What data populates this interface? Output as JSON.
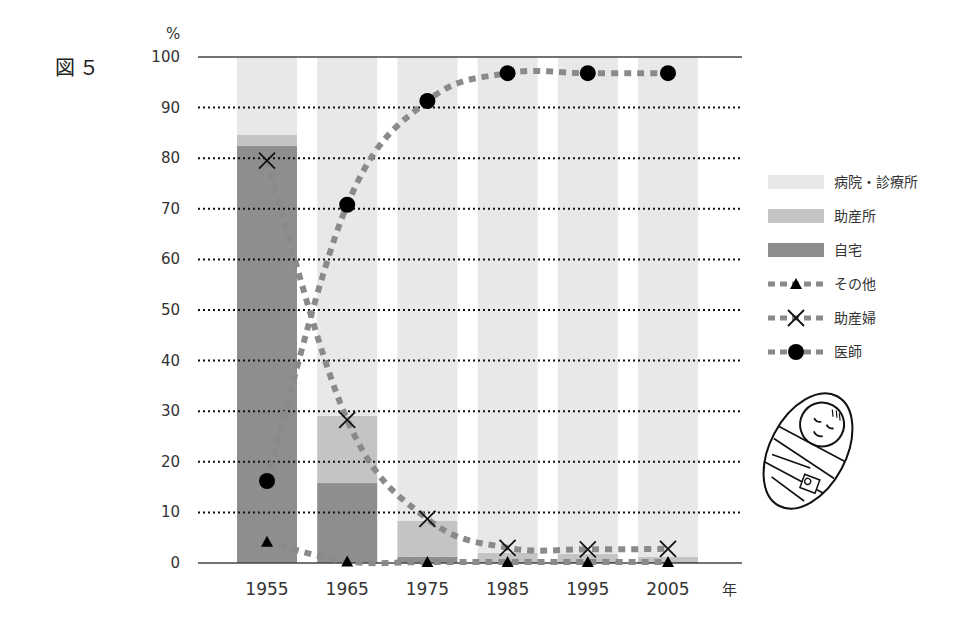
{
  "figure_label": "図５",
  "chart_data": {
    "type": "bar",
    "title": "",
    "xlabel": "年",
    "ylabel": "%",
    "ylim": [
      0,
      100
    ],
    "yticks": [
      0,
      10,
      20,
      30,
      40,
      50,
      60,
      70,
      80,
      90,
      100
    ],
    "grid": true,
    "legend_position": "right",
    "categories": [
      "1955",
      "1965",
      "1975",
      "1985",
      "1995",
      "2005"
    ],
    "stacked_series": [
      {
        "name": "自宅",
        "color": "#8e8e8e",
        "values": [
          82.5,
          15.8,
          1.2,
          0.2,
          0.2,
          0.2
        ]
      },
      {
        "name": "助産所",
        "color": "#c4c4c4",
        "values": [
          2.1,
          13.3,
          7.1,
          1.8,
          1.6,
          1.0
        ]
      },
      {
        "name": "病院・診療所",
        "color": "#e8e8e8",
        "values": [
          15.4,
          70.9,
          91.7,
          98.0,
          98.2,
          98.8
        ]
      }
    ],
    "line_series": [
      {
        "name": "その他",
        "marker": "triangle",
        "values": [
          4.2,
          0.3,
          0.2,
          0.2,
          0.2,
          0.2
        ]
      },
      {
        "name": "助産婦",
        "marker": "x",
        "values": [
          79.5,
          28.3,
          8.7,
          3.0,
          2.7,
          2.8
        ]
      },
      {
        "name": "医師",
        "marker": "circle",
        "values": [
          16.2,
          70.8,
          91.3,
          96.8,
          96.8,
          96.8
        ]
      }
    ],
    "line_color": "#8a8a8a"
  }
}
